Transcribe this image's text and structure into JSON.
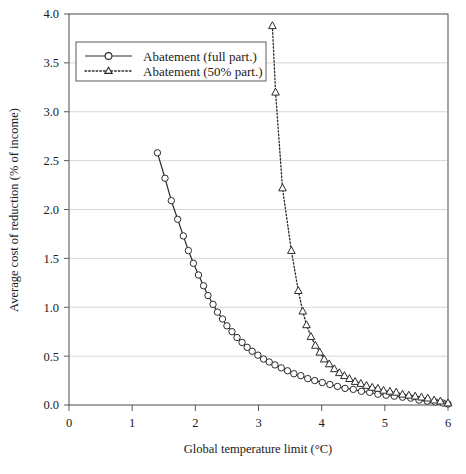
{
  "chart_data": {
    "type": "line",
    "title": "",
    "xlabel": "Global temperature limit (°C)",
    "ylabel": "Average cost of reduction (% of income)",
    "xlim": [
      0,
      6
    ],
    "ylim": [
      0,
      4.0
    ],
    "xticks": [
      "0",
      "1",
      "2",
      "3",
      "4",
      "5",
      "6"
    ],
    "xtick_values": [
      0,
      1,
      2,
      3,
      4,
      5,
      6
    ],
    "yticks": [
      "0.0",
      "0.5",
      "1.0",
      "1.5",
      "2.0",
      "2.5",
      "3.0",
      "3.5",
      "4.0"
    ],
    "ytick_values": [
      0.0,
      0.5,
      1.0,
      1.5,
      2.0,
      2.5,
      3.0,
      3.5,
      4.0
    ],
    "grid": "horizontal",
    "legend_position": "upper-left",
    "series": [
      {
        "name": "Abatement (full part.)",
        "marker": "circle-open",
        "linestyle": "solid",
        "color": "#2b2b2b",
        "points": [
          [
            1.4,
            2.58
          ],
          [
            1.52,
            2.32
          ],
          [
            1.62,
            2.09
          ],
          [
            1.72,
            1.9
          ],
          [
            1.81,
            1.73
          ],
          [
            1.89,
            1.58
          ],
          [
            1.97,
            1.45
          ],
          [
            2.05,
            1.33
          ],
          [
            2.13,
            1.22
          ],
          [
            2.2,
            1.12
          ],
          [
            2.28,
            1.03
          ],
          [
            2.35,
            0.95
          ],
          [
            2.43,
            0.88
          ],
          [
            2.5,
            0.81
          ],
          [
            2.58,
            0.75
          ],
          [
            2.66,
            0.69
          ],
          [
            2.74,
            0.64
          ],
          [
            2.82,
            0.59
          ],
          [
            2.9,
            0.55
          ],
          [
            2.99,
            0.51
          ],
          [
            3.08,
            0.47
          ],
          [
            3.17,
            0.44
          ],
          [
            3.26,
            0.41
          ],
          [
            3.36,
            0.38
          ],
          [
            3.46,
            0.35
          ],
          [
            3.56,
            0.32
          ],
          [
            3.67,
            0.3
          ],
          [
            3.78,
            0.27
          ],
          [
            3.89,
            0.25
          ],
          [
            4.01,
            0.23
          ],
          [
            4.13,
            0.21
          ],
          [
            4.25,
            0.19
          ],
          [
            4.37,
            0.17
          ],
          [
            4.5,
            0.16
          ],
          [
            4.63,
            0.14
          ],
          [
            4.76,
            0.13
          ],
          [
            4.89,
            0.11
          ],
          [
            5.02,
            0.1
          ],
          [
            5.15,
            0.09
          ],
          [
            5.28,
            0.08
          ],
          [
            5.41,
            0.07
          ],
          [
            5.54,
            0.05
          ],
          [
            5.67,
            0.04
          ],
          [
            5.8,
            0.03
          ],
          [
            5.92,
            0.02
          ],
          [
            6.0,
            0.01
          ]
        ]
      },
      {
        "name": "Abatement (50% part.)",
        "marker": "triangle-open",
        "linestyle": "dotted",
        "color": "#2b2b2b",
        "points": [
          [
            3.22,
            3.88
          ],
          [
            3.27,
            3.2
          ],
          [
            3.38,
            2.22
          ],
          [
            3.52,
            1.58
          ],
          [
            3.63,
            1.17
          ],
          [
            3.7,
            0.96
          ],
          [
            3.76,
            0.82
          ],
          [
            3.83,
            0.7
          ],
          [
            3.9,
            0.61
          ],
          [
            3.97,
            0.54
          ],
          [
            4.04,
            0.47
          ],
          [
            4.12,
            0.42
          ],
          [
            4.2,
            0.37
          ],
          [
            4.28,
            0.33
          ],
          [
            4.36,
            0.3
          ],
          [
            4.44,
            0.27
          ],
          [
            4.53,
            0.24
          ],
          [
            4.62,
            0.22
          ],
          [
            4.71,
            0.2
          ],
          [
            4.8,
            0.18
          ],
          [
            4.89,
            0.17
          ],
          [
            4.98,
            0.15
          ],
          [
            5.08,
            0.14
          ],
          [
            5.18,
            0.13
          ],
          [
            5.28,
            0.11
          ],
          [
            5.38,
            0.1
          ],
          [
            5.48,
            0.09
          ],
          [
            5.58,
            0.08
          ],
          [
            5.68,
            0.07
          ],
          [
            5.78,
            0.05
          ],
          [
            5.88,
            0.04
          ],
          [
            6.0,
            0.02
          ]
        ]
      }
    ]
  },
  "legend": {
    "items": [
      {
        "label": "Abatement (full part.)"
      },
      {
        "label": "Abatement (50% part.)"
      }
    ]
  },
  "style": {
    "axis_color": "#5a5a5a",
    "grid_color": "#d6d6d6",
    "line_color": "#2b2b2b",
    "background": "#ffffff"
  }
}
